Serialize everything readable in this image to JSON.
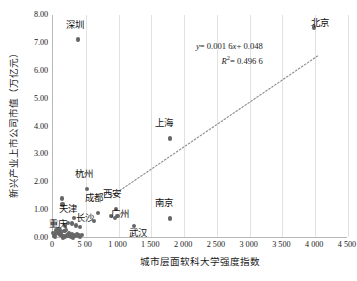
{
  "chart_data": {
    "type": "scatter",
    "title": "",
    "xlabel": "城市层面软科大学强度指数",
    "ylabel": "新兴产业上市公司市值（万亿元）",
    "xlim": [
      0,
      4500
    ],
    "ylim": [
      0,
      8.0
    ],
    "grid": "vertical",
    "legend": "none",
    "xticks": [
      "0",
      "5 00",
      "1 000",
      "1 500",
      "2 000",
      "2 500",
      "3 000",
      "3 500",
      "4 000",
      "4 500"
    ],
    "xtick_values": [
      0,
      500,
      1000,
      1500,
      2000,
      2500,
      3000,
      3500,
      4000,
      4500
    ],
    "yticks": [
      "0.00",
      "1.00",
      "2.00",
      "3.00",
      "4.00",
      "5.00",
      "6.00",
      "7.00",
      "8.00"
    ],
    "ytick_values": [
      0.0,
      1.0,
      2.0,
      3.0,
      4.0,
      5.0,
      6.0,
      7.0,
      8.0
    ],
    "annotations": {
      "equation": "y = 0.001 6x + 0.048",
      "equation_lhs": "y",
      "equation_rhs": "= 0.001 6",
      "equation_var": "x",
      "equation_tail": "+ 0.048",
      "r_symbol": "R",
      "r_exponent": "2",
      "r_value": "= 0.496 6"
    },
    "trendline": {
      "slope": 0.0016,
      "intercept": 0.048,
      "r_squared": 0.4966,
      "style": "dotted",
      "x_start": 900,
      "x_end": 4050
    },
    "labeled_points": [
      {
        "label": "深圳",
        "x": 400,
        "y": 7.12,
        "label_dx": -3,
        "label_dy": -14
      },
      {
        "label": "北京",
        "x": 4000,
        "y": 7.55,
        "label_dx": 6,
        "label_dy": -4
      },
      {
        "label": "上海",
        "x": 1800,
        "y": 3.57,
        "label_dx": -6,
        "label_dy": -14
      },
      {
        "label": "杭州",
        "x": 540,
        "y": 1.75,
        "label_dx": -3,
        "label_dy": -14
      },
      {
        "label": "成都",
        "x": 700,
        "y": 0.9,
        "label_dx": -4,
        "label_dy": -14
      },
      {
        "label": "西安",
        "x": 980,
        "y": 1.05,
        "label_dx": -4,
        "label_dy": -14
      },
      {
        "label": "天津",
        "x": 330,
        "y": 0.72,
        "label_dx": -6,
        "label_dy": -8
      },
      {
        "label": "长沙",
        "x": 640,
        "y": 0.62,
        "label_dx": -9,
        "label_dy": -2
      },
      {
        "label": "广州",
        "x": 1000,
        "y": 0.8,
        "label_dx": 2,
        "label_dy": -1
      },
      {
        "label": "南京",
        "x": 1800,
        "y": 0.7,
        "label_dx": -6,
        "label_dy": -14
      },
      {
        "label": "武汉",
        "x": 1250,
        "y": 0.42,
        "label_dx": 4,
        "label_dy": 8
      },
      {
        "label": "重庆",
        "x": 200,
        "y": 0.45,
        "label_dx": -7,
        "label_dy": 0
      }
    ],
    "unlabeled_points": [
      {
        "x": 150,
        "y": 1.42
      },
      {
        "x": 160,
        "y": 1.2
      },
      {
        "x": 250,
        "y": 0.55
      },
      {
        "x": 300,
        "y": 0.52
      },
      {
        "x": 360,
        "y": 0.45
      },
      {
        "x": 430,
        "y": 0.4
      },
      {
        "x": 900,
        "y": 0.78
      },
      {
        "x": 960,
        "y": 0.72
      },
      {
        "x": 60,
        "y": 0.3
      },
      {
        "x": 70,
        "y": 0.22
      },
      {
        "x": 90,
        "y": 0.18
      },
      {
        "x": 110,
        "y": 0.14
      },
      {
        "x": 130,
        "y": 0.1
      },
      {
        "x": 150,
        "y": 0.08
      },
      {
        "x": 175,
        "y": 0.06
      },
      {
        "x": 200,
        "y": 0.05
      },
      {
        "x": 225,
        "y": 0.12
      },
      {
        "x": 250,
        "y": 0.09
      },
      {
        "x": 275,
        "y": 0.07
      },
      {
        "x": 300,
        "y": 0.15
      },
      {
        "x": 330,
        "y": 0.11
      },
      {
        "x": 355,
        "y": 0.06
      },
      {
        "x": 380,
        "y": 0.13
      },
      {
        "x": 405,
        "y": 0.09
      },
      {
        "x": 430,
        "y": 0.05
      },
      {
        "x": 455,
        "y": 0.1
      },
      {
        "x": 40,
        "y": 0.12
      },
      {
        "x": 50,
        "y": 0.04
      },
      {
        "x": 80,
        "y": 0.26
      },
      {
        "x": 100,
        "y": 0.33
      },
      {
        "x": 120,
        "y": 0.28
      },
      {
        "x": 140,
        "y": 0.2
      },
      {
        "x": 190,
        "y": 0.24
      },
      {
        "x": 215,
        "y": 0.3
      },
      {
        "x": 30,
        "y": 0.08
      },
      {
        "x": 265,
        "y": 0.18
      },
      {
        "x": 290,
        "y": 0.03
      },
      {
        "x": 320,
        "y": 0.02
      },
      {
        "x": 20,
        "y": 0.18
      },
      {
        "x": 165,
        "y": 0.02
      }
    ]
  }
}
